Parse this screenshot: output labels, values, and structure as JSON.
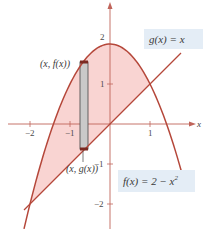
{
  "chart_data": {
    "type": "line",
    "title": "",
    "xlabel": "x",
    "ylabel": "y",
    "xlim": [
      -2.75,
      2.4
    ],
    "ylim": [
      -2.7,
      3.1
    ],
    "grid": false,
    "x_ticks": [
      -2,
      -1,
      1
    ],
    "y_ticks": [
      2,
      1,
      -1,
      -2
    ],
    "x_tick_labels": [
      "−2",
      "−1",
      "1"
    ],
    "y_tick_labels": [
      "2",
      "1",
      "−1",
      "−2"
    ],
    "series": [
      {
        "name": "f(x) = 2 − x²",
        "expression": "2 - x^2",
        "x_range": [
          -2.15,
          1.78
        ]
      },
      {
        "name": "g(x) = x",
        "expression": "x",
        "x_range": [
          -2.15,
          1.78
        ]
      }
    ],
    "shaded_region": {
      "between": [
        "f",
        "g"
      ],
      "x_range": [
        -2,
        1
      ]
    },
    "intersections": [
      [
        -2,
        -2
      ],
      [
        1,
        1
      ]
    ],
    "representative_rectangle": {
      "x": -0.65,
      "width": 0.2,
      "top_label": "(x, f(x))",
      "bottom_label": "(x, g(x))"
    },
    "annotations": [
      "g(x) = x",
      "f(x) = 2 − x²",
      "(x, f(x))",
      "(x, g(x))"
    ]
  },
  "labels": {
    "g_label": "g(x) = x",
    "f_label_main": "f(x) = 2 − x",
    "f_label_sup": "2",
    "top_point": "(x, f(x))",
    "bottom_point": "(x, g(x))",
    "x_axis": "x"
  },
  "ticks": {
    "xm2": "−2",
    "xm1": "−1",
    "x1": "1",
    "y2": "2",
    "y1": "1",
    "ym1": "−1",
    "ym2": "−2"
  },
  "colors": {
    "curve": "#b5473a",
    "fill": "#f9d4d2",
    "label_box": "#e4edf6",
    "axis": "#c0645a",
    "rect_fill": "#c9c9c9"
  }
}
